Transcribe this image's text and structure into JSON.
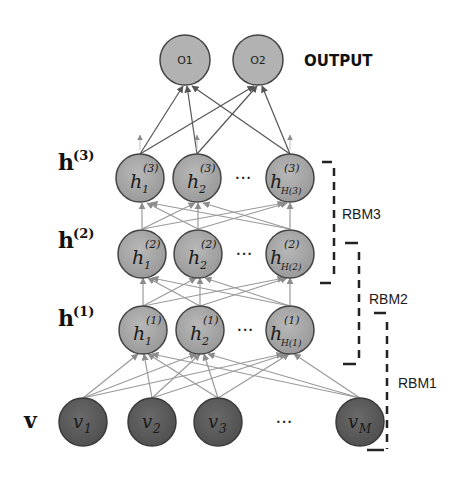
{
  "diagram": {
    "type": "deep-belief-network",
    "output_label": "OUTPUT",
    "output_nodes": [
      {
        "id": "o1",
        "label": "O1"
      },
      {
        "id": "o2",
        "label": "O2"
      }
    ],
    "layers": [
      {
        "id": "h3",
        "label": "h",
        "sup": "(3)",
        "nodes": [
          {
            "base": "h",
            "sub": "1",
            "sup": "(3)"
          },
          {
            "base": "h",
            "sub": "2",
            "sup": "(3)"
          },
          {
            "base": "h",
            "sub": "H(3)",
            "sup": "(3)"
          }
        ]
      },
      {
        "id": "h2",
        "label": "h",
        "sup": "(2)",
        "nodes": [
          {
            "base": "h",
            "sub": "1",
            "sup": "(2)"
          },
          {
            "base": "h",
            "sub": "2",
            "sup": "(2)"
          },
          {
            "base": "h",
            "sub": "H(2)",
            "sup": "(2)"
          }
        ]
      },
      {
        "id": "h1",
        "label": "h",
        "sup": "(1)",
        "nodes": [
          {
            "base": "h",
            "sub": "1",
            "sup": "(1)"
          },
          {
            "base": "h",
            "sub": "2",
            "sup": "(1)"
          },
          {
            "base": "h",
            "sub": "H(1)",
            "sup": "(1)"
          }
        ]
      },
      {
        "id": "v",
        "label": "v",
        "sup": "",
        "nodes": [
          {
            "base": "v",
            "sub": "1"
          },
          {
            "base": "v",
            "sub": "2"
          },
          {
            "base": "v",
            "sub": "3"
          },
          {
            "base": "v",
            "sub": "M"
          }
        ]
      }
    ],
    "ellipsis": "···",
    "rbm_brackets": [
      {
        "id": "rbm3",
        "label": "RBM3"
      },
      {
        "id": "rbm2",
        "label": "RBM2"
      },
      {
        "id": "rbm1",
        "label": "RBM1"
      }
    ],
    "colors": {
      "hidden_node_fill": "#a8a8a8",
      "output_node_fill": "#b0b0b0",
      "visible_node_fill": "#5e5e5e",
      "node_stroke": "#444444",
      "edge": "#8c8c8c",
      "out_edge": "#555555"
    }
  }
}
